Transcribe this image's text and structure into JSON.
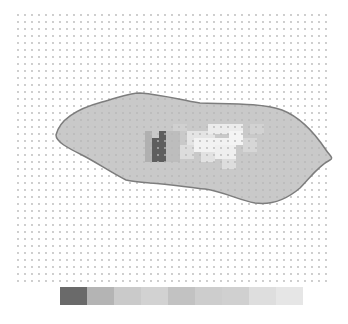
{
  "figure": {
    "type": "grid-heatmap-map",
    "background": "#ffffff",
    "dot_grid": {
      "x0": 18,
      "y0": 15,
      "x1": 330,
      "y1": 283,
      "spacing": 7,
      "dot_radius": 0.9,
      "dot_color": "#b8b8b8"
    },
    "outline": {
      "stroke": "#7d7d7d",
      "fill": "#c9c9c9",
      "path": "M56,135 C60,118 80,108 102,102 C118,98 128,93 140,93 C165,95 180,100 200,103 C230,104 262,103 282,110 C300,117 316,135 326,150 C330,156 334,158 330,160 C318,166 310,178 300,188 C286,200 270,205 255,203 C238,200 225,192 205,189 C185,187 170,184 150,183 C138,182 130,181 126,180 C110,172 96,162 82,155 C68,148 56,142 56,135 Z"
    },
    "cells": [
      {
        "x": 152,
        "y": 138,
        "w": 14,
        "h": 24,
        "color": "#5e5e5e"
      },
      {
        "x": 159,
        "y": 131,
        "w": 7,
        "h": 8,
        "color": "#5e5e5e"
      },
      {
        "x": 145,
        "y": 131,
        "w": 7,
        "h": 31,
        "color": "#b0b0b0"
      },
      {
        "x": 166,
        "y": 131,
        "w": 14,
        "h": 31,
        "color": "#bdbdbd"
      },
      {
        "x": 187,
        "y": 131,
        "w": 28,
        "h": 14,
        "color": "#e4e4e4"
      },
      {
        "x": 208,
        "y": 124,
        "w": 35,
        "h": 10,
        "color": "#ececec"
      },
      {
        "x": 194,
        "y": 138,
        "w": 42,
        "h": 14,
        "color": "#f2f2f2"
      },
      {
        "x": 215,
        "y": 145,
        "w": 21,
        "h": 14,
        "color": "#efefef"
      },
      {
        "x": 229,
        "y": 131,
        "w": 14,
        "h": 14,
        "color": "#f4f4f4"
      },
      {
        "x": 180,
        "y": 145,
        "w": 14,
        "h": 14,
        "color": "#dcdcdc"
      },
      {
        "x": 201,
        "y": 152,
        "w": 14,
        "h": 10,
        "color": "#e2e2e2"
      },
      {
        "x": 222,
        "y": 159,
        "w": 14,
        "h": 10,
        "color": "#dddddd"
      },
      {
        "x": 243,
        "y": 138,
        "w": 14,
        "h": 14,
        "color": "#d6d6d6"
      },
      {
        "x": 173,
        "y": 124,
        "w": 14,
        "h": 7,
        "color": "#d0d0d0"
      },
      {
        "x": 250,
        "y": 124,
        "w": 14,
        "h": 10,
        "color": "#d2d2d2"
      }
    ],
    "colorbar": {
      "x": 60,
      "y": 287,
      "width": 243,
      "height": 18,
      "segments": [
        "#6a6a6a",
        "#b4b4b4",
        "#cacaca",
        "#d2d2d2",
        "#c2c2c2",
        "#cdcdcd",
        "#d0d0d0",
        "#dedede",
        "#e6e6e6"
      ]
    }
  }
}
